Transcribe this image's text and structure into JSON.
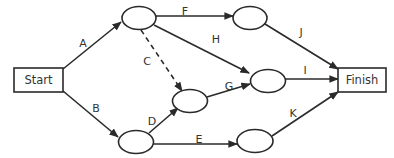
{
  "diagram": {
    "type": "activity-on-arrow network",
    "start": {
      "label": "Start",
      "x": 14,
      "y": 68,
      "w": 49,
      "h": 24
    },
    "finish": {
      "label": "Finish",
      "x": 338,
      "y": 68,
      "w": 48,
      "h": 24
    },
    "nodes": [
      {
        "id": "n1",
        "cx": 139,
        "cy": 18
      },
      {
        "id": "n2",
        "cx": 136,
        "cy": 142
      },
      {
        "id": "n3",
        "cx": 190,
        "cy": 101
      },
      {
        "id": "n4",
        "cx": 250,
        "cy": 18
      },
      {
        "id": "n5",
        "cx": 268,
        "cy": 81
      },
      {
        "id": "n6",
        "cx": 255,
        "cy": 141
      }
    ],
    "edges": [
      {
        "label": "A",
        "from": "start",
        "to": "n1",
        "style": "solid",
        "lx": 83,
        "ly": 47
      },
      {
        "label": "B",
        "from": "start",
        "to": "n2",
        "style": "solid",
        "lx": 96,
        "ly": 112
      },
      {
        "label": "C",
        "from": "n1",
        "to": "n3",
        "style": "dashed",
        "lx": 147,
        "ly": 65
      },
      {
        "label": "D",
        "from": "n2",
        "to": "n3",
        "style": "solid",
        "lx": 152,
        "ly": 125
      },
      {
        "label": "E",
        "from": "n2",
        "to": "n6",
        "style": "solid",
        "lx": 199,
        "ly": 143
      },
      {
        "label": "F",
        "from": "n1",
        "to": "n4",
        "style": "solid",
        "lx": 185,
        "ly": 15
      },
      {
        "label": "G",
        "from": "n3",
        "to": "n5",
        "style": "solid",
        "lx": 229,
        "ly": 90
      },
      {
        "label": "H",
        "from": "n1",
        "to": "n5",
        "style": "solid",
        "lx": 216,
        "ly": 43
      },
      {
        "label": "I",
        "from": "n5",
        "to": "finish",
        "style": "solid",
        "lx": 305,
        "ly": 74
      },
      {
        "label": "J",
        "from": "n4",
        "to": "finish",
        "style": "solid",
        "lx": 301,
        "ly": 36
      },
      {
        "label": "K",
        "from": "n6",
        "to": "finish",
        "style": "solid",
        "lx": 293,
        "ly": 117
      }
    ]
  }
}
